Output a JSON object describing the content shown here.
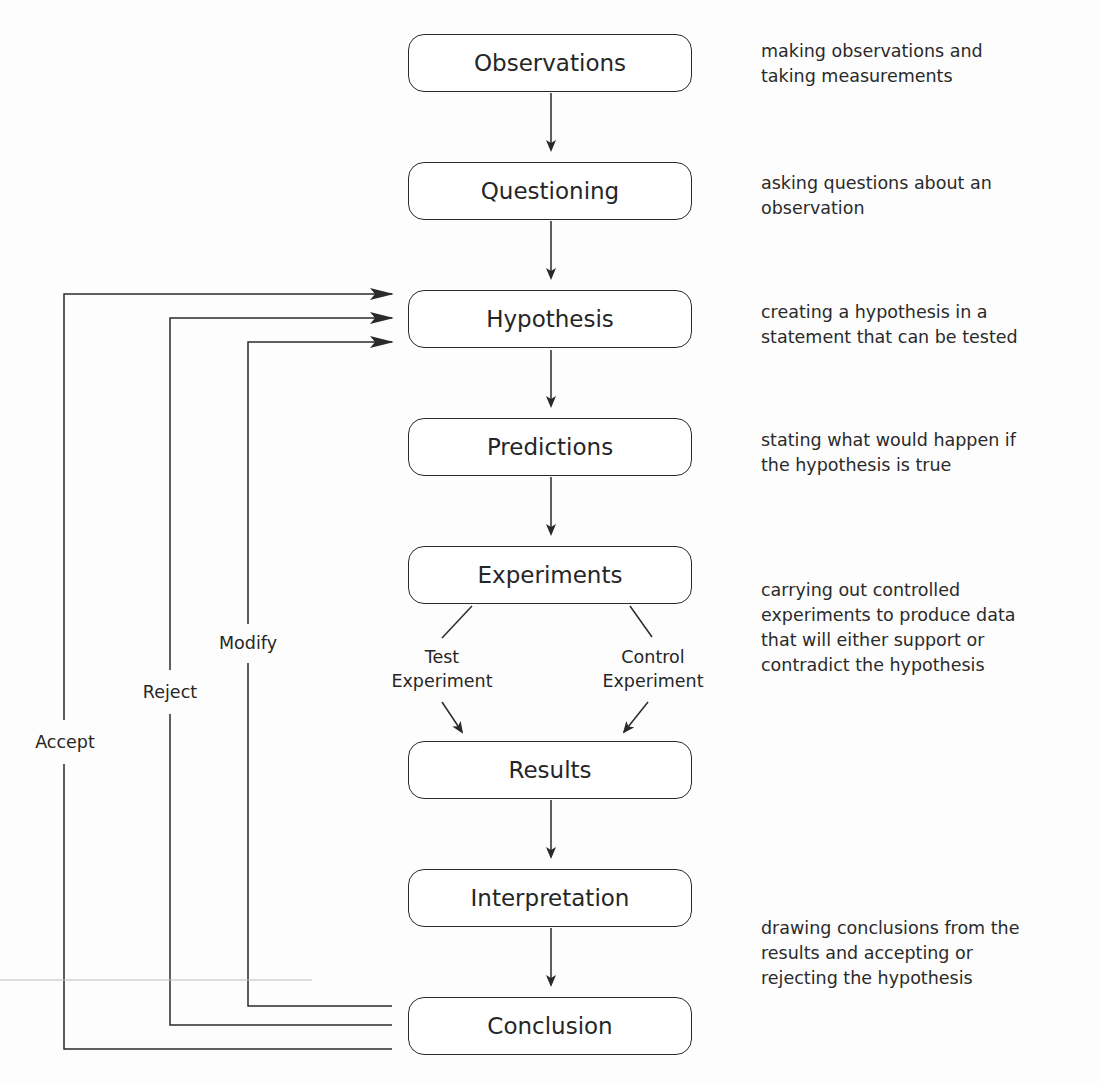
{
  "steps": [
    {
      "label": "Observations",
      "description": "making observations and\ntaking measurements"
    },
    {
      "label": "Questioning",
      "description": "asking questions about an\nobservation"
    },
    {
      "label": "Hypothesis",
      "description": "creating a hypothesis in a\nstatement that can be tested"
    },
    {
      "label": "Predictions",
      "description": "stating what would happen if\nthe hypothesis is true"
    },
    {
      "label": "Experiments",
      "description": "carrying out controlled\nexperiments to produce data\nthat will either support or\ncontradict the hypothesis"
    },
    {
      "label": "Results",
      "description": ""
    },
    {
      "label": "Interpretation",
      "description": "drawing conclusions from the\nresults and accepting or\nrejecting the hypothesis"
    },
    {
      "label": "Conclusion",
      "description": ""
    }
  ],
  "branches": {
    "test": "Test\nExperiment",
    "control": "Control\nExperiment"
  },
  "feedback": {
    "modify": "Modify",
    "reject": "Reject",
    "accept": "Accept"
  },
  "colors": {
    "line": "#2a2a2a",
    "text": "#262626",
    "background": "#fdfdfd"
  }
}
